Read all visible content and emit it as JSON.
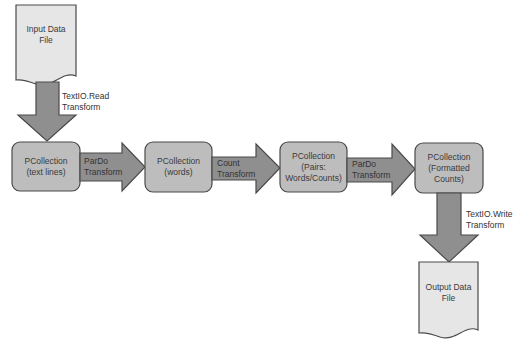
{
  "colors": {
    "node_fill": "#bdbdbd",
    "node_stroke": "#4a4a4a",
    "arrow_fill": "#8f8f8f",
    "doc_fill": "#e6e6e6",
    "text": "#333333"
  },
  "input_file": {
    "line1": "Input Data",
    "line2": "File"
  },
  "output_file": {
    "line1": "Output Data",
    "line2": "File"
  },
  "nodes": [
    {
      "line1": "PCollection",
      "line2": "(text lines)",
      "line3": ""
    },
    {
      "line1": "PCollection",
      "line2": "(words)",
      "line3": ""
    },
    {
      "line1": "PCollection",
      "line2": "(Pairs:",
      "line3": "Words/Counts)"
    },
    {
      "line1": "PCollection",
      "line2": "(Formatted",
      "line3": "Counts)"
    }
  ],
  "transforms": [
    {
      "line1": "TextIO.Read",
      "line2": "Transform"
    },
    {
      "line1": "ParDo",
      "line2": "Transform"
    },
    {
      "line1": "Count",
      "line2": "Transform"
    },
    {
      "line1": "ParDo",
      "line2": "Transform"
    },
    {
      "line1": "TextIO.Write",
      "line2": "Transform"
    }
  ]
}
